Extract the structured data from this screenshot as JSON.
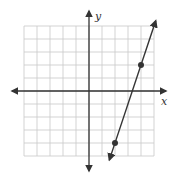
{
  "chart_data": {
    "type": "line",
    "title": "",
    "xlabel": "x",
    "ylabel": "y",
    "xlim": [
      -5,
      5
    ],
    "ylim": [
      -5,
      5
    ],
    "grid": true,
    "grid_step": 1,
    "tick_labels": false,
    "series": [
      {
        "name": "line",
        "equation": "y = 3x - 10",
        "slope": 3,
        "intercept": -10,
        "marked_points": [
          {
            "x": 4,
            "y": 2
          },
          {
            "x": 2,
            "y": -4
          }
        ],
        "arrows_both_ends": true
      }
    ]
  },
  "colors": {
    "grid": "#c8c8c8",
    "axis": "#333333",
    "line": "#333333",
    "point": "#333333"
  },
  "labels": {
    "x_axis": "x",
    "y_axis": "y"
  }
}
